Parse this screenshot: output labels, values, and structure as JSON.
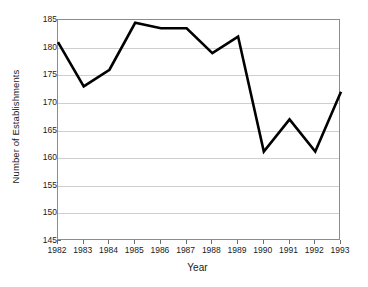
{
  "chart_data": {
    "type": "line",
    "title": "",
    "xlabel": "Year",
    "ylabel": "Number of Establishments",
    "categories": [
      "1982",
      "1983",
      "1984",
      "1985",
      "1986",
      "1987",
      "1988",
      "1989",
      "1990",
      "1991",
      "1992",
      "1993"
    ],
    "x": [
      1982,
      1983,
      1984,
      1985,
      1986,
      1987,
      1988,
      1989,
      1990,
      1991,
      1992,
      1993
    ],
    "values": [
      181,
      173,
      176,
      184.5,
      183.5,
      183.5,
      179,
      182,
      161.2,
      167,
      161.2,
      172
    ],
    "series": [
      {
        "name": "Number of Establishments",
        "values": [
          181,
          173,
          176,
          184.5,
          183.5,
          183.5,
          179,
          182,
          161.2,
          167,
          161.2,
          172
        ]
      }
    ],
    "xlim": [
      1982,
      1993
    ],
    "ylim": [
      145,
      185
    ],
    "yticks": [
      145,
      150,
      155,
      160,
      165,
      170,
      175,
      180,
      185
    ],
    "ytick_labels": [
      "145",
      "150",
      "155",
      "160",
      "165",
      "170",
      "175",
      "180",
      "185"
    ],
    "xtick_labels": [
      "1982",
      "1983",
      "1984",
      "1985",
      "1986",
      "1987",
      "1988",
      "1989",
      "1990",
      "1991",
      "1992",
      "1993"
    ],
    "grid": "horizontal",
    "legend": "none",
    "line_color": "#000000",
    "grid_color": "#cfcfcf",
    "frame_color": "#8c8c8c",
    "background_color": "#ffffff"
  }
}
